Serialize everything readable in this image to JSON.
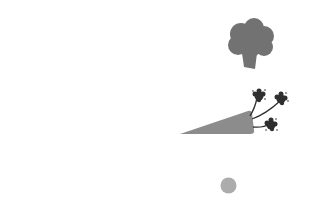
{
  "scene": {
    "background": "#ffffff",
    "items": [
      {
        "name": "broccoli",
        "color": "#727272",
        "x": 226,
        "y": 17,
        "w": 50,
        "h": 52
      },
      {
        "name": "carrot",
        "body_color": "#8c8c8c",
        "leaf_color": "#2f2f2f",
        "x": 178,
        "y": 84,
        "w": 116,
        "h": 52
      },
      {
        "name": "dot",
        "color": "#acacac",
        "x": 220,
        "y": 177,
        "w": 17,
        "h": 17
      }
    ]
  }
}
